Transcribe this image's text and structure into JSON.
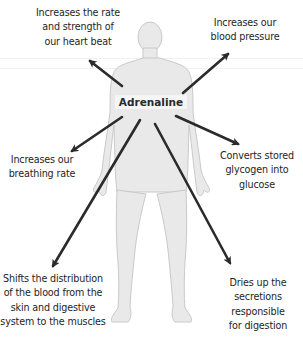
{
  "diagram": {
    "center": {
      "label": "Adrenaline"
    },
    "effects": [
      {
        "id": "heart",
        "lines": [
          "Increases the rate",
          "and strength of",
          "our heart beat"
        ]
      },
      {
        "id": "blood-pressure",
        "lines": [
          "Increases our",
          "blood pressure"
        ]
      },
      {
        "id": "breathing",
        "lines": [
          "Increases our",
          "breathing rate"
        ]
      },
      {
        "id": "glycogen",
        "lines": [
          "Converts stored",
          "glycogen into",
          "glucose"
        ]
      },
      {
        "id": "blood-distribution",
        "lines": [
          "Shifts the distribution",
          "of the blood from the",
          "skin and digestive",
          "system to the muscles"
        ]
      },
      {
        "id": "digestion",
        "lines": [
          "Dries up the",
          "secretions",
          "responsible",
          "for digestion"
        ]
      }
    ],
    "colors": {
      "body_fill": "#e9e9e9",
      "body_outline": "#c9c9c9",
      "arrow": "#2b2b2b",
      "text": "#1e1e1e"
    }
  }
}
